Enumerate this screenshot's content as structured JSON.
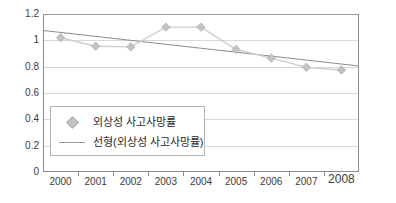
{
  "chart_data": {
    "type": "line",
    "title": "",
    "subtitle": "",
    "xlabel": "",
    "ylabel": "",
    "categories": [
      "2000",
      "2001",
      "2002",
      "2003",
      "2004",
      "2005",
      "2006",
      "2007",
      "2008"
    ],
    "series": [
      {
        "name": "외상성 사고사망률",
        "marker": "diamond",
        "color": "#c3c3c3",
        "values": [
          1.02,
          0.955,
          0.95,
          1.1,
          1.1,
          0.93,
          0.865,
          0.795,
          0.775
        ]
      },
      {
        "name": "선형(외상성 사고사망률)",
        "marker": "line",
        "color": "#8c8c8c",
        "values": [
          1.06,
          1.03,
          1.0,
          0.97,
          0.94,
          0.91,
          0.88,
          0.85,
          0.82
        ]
      }
    ],
    "ylim": [
      0,
      1.2
    ],
    "yticks": [
      0,
      0.2,
      0.4,
      0.6,
      0.8,
      1,
      1.2
    ],
    "ytick_labels": [
      "0",
      "0.2",
      "0.4",
      "0.6",
      "0.8",
      "1",
      "1.2"
    ],
    "grid": true,
    "grid_axis": "y",
    "legend_position": "inside-lower-left"
  },
  "legend": {
    "entries": [
      {
        "label": "외상성 사고사망률",
        "icon": "diamond-marker-icon"
      },
      {
        "label": "선형(외상성 사고사망률)",
        "icon": "line-marker-icon"
      }
    ]
  },
  "colors": {
    "series_marker": "#c3c3c3",
    "series_line": "#cdcdcd",
    "trendline": "#8c8c8c",
    "axis": "#8c8c8c",
    "gridline": "#d8d8d8",
    "text": "#3c3c3c",
    "background": "#ffffff"
  }
}
